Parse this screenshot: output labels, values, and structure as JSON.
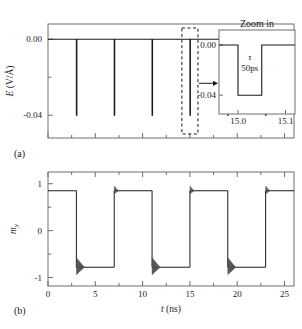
{
  "figure": {
    "panels": [
      {
        "id": "a",
        "label": "(a)",
        "ylabel": "E (V/Å)",
        "ylabel_parts": {
          "symbol": "E",
          "units": "(V/Å)"
        },
        "y_ticks": [
          "0.00",
          "-0.04"
        ],
        "x_ticks": [
          "",
          "",
          "",
          "",
          "",
          ""
        ]
      },
      {
        "id": "b",
        "label": "(b)",
        "ylabel": "m_y",
        "ylabel_parts": {
          "symbol": "m",
          "sub": "y"
        },
        "xlabel": "t (ns)",
        "xlabel_parts": {
          "symbol": "t",
          "units": "(ns)"
        },
        "y_ticks": [
          "1",
          "0",
          "-1"
        ],
        "x_ticks": [
          "0",
          "5",
          "10",
          "15",
          "20",
          "25"
        ]
      }
    ],
    "inset": {
      "title": "Zoom in",
      "y_ticks": [
        "0.00",
        "-0.04"
      ],
      "x_ticks": [
        "15.0",
        "15.1"
      ],
      "tau_symbol": "τ",
      "tau_value": "50ps"
    },
    "colors": {
      "line": "#1a1a1a",
      "axis": "#6e6e6e",
      "background": "#ffffff",
      "spike": "#4a4a4a"
    }
  },
  "chart_data": [
    {
      "type": "line",
      "id": "panel-a",
      "title": "",
      "xlabel": "",
      "ylabel": "E (V/Å)",
      "xlim": [
        0,
        26
      ],
      "ylim": [
        -0.052,
        0.008
      ],
      "yticks": [
        0.0,
        -0.04
      ],
      "ytick_labels": [
        "0.00",
        "-0.04"
      ],
      "xticks": [
        0,
        5,
        10,
        15,
        20,
        25
      ],
      "xtick_labels": [
        "",
        "",
        "",
        "",
        "",
        ""
      ],
      "grid": false,
      "description": "Electric field pulse train: baseline 0.00 V/A with narrow negative pulses of amplitude -0.04 V/A and width 50 ps",
      "baseline": 0.0,
      "pulse_amplitude": -0.04,
      "pulse_width_ns": 0.05,
      "pulse_times_ns": [
        3.0,
        7.0,
        11.0,
        15.0,
        19.0,
        23.0
      ],
      "highlight_box": {
        "center_ns": 15.0,
        "half_width_ns": 0.85
      }
    },
    {
      "type": "line",
      "id": "panel-a-inset",
      "title": "Zoom in",
      "xlabel": "",
      "ylabel": "",
      "xlim": [
        14.96,
        15.12
      ],
      "ylim": [
        -0.055,
        0.012
      ],
      "yticks": [
        0.0,
        -0.04
      ],
      "ytick_labels": [
        "0.00",
        "-0.04"
      ],
      "xticks": [
        15.0,
        15.1
      ],
      "xtick_labels": [
        "15.0",
        "15.1"
      ],
      "grid": false,
      "description": "Magnified single rectangular pulse of duration tau = 50 ps",
      "x": [
        14.96,
        15.0,
        15.0,
        15.05,
        15.05,
        15.12
      ],
      "y": [
        0.0,
        0.0,
        -0.04,
        -0.04,
        0.0,
        0.0
      ],
      "annotations": [
        {
          "text": "τ",
          "x": 15.025,
          "y": -0.012
        },
        {
          "text": "50ps",
          "x": 15.025,
          "y": -0.021
        }
      ]
    },
    {
      "type": "line",
      "id": "panel-b",
      "title": "",
      "xlabel": "t (ns)",
      "ylabel": "m_y",
      "xlim": [
        0,
        26
      ],
      "ylim": [
        -1.18,
        1.25
      ],
      "yticks": [
        1,
        0,
        -1
      ],
      "ytick_labels": [
        "1",
        "0",
        "-1"
      ],
      "xticks": [
        0,
        5,
        10,
        15,
        20,
        25
      ],
      "xtick_labels": [
        "0",
        "5",
        "10",
        "15",
        "20",
        "25"
      ],
      "grid": false,
      "description": "Magnetization y-component toggling between +0.85 and -0.78 at each field pulse, with damped ringing after each switch",
      "high_level": 0.85,
      "low_level": -0.78,
      "switch_times_ns": [
        3.0,
        7.0,
        11.0,
        15.0,
        19.0,
        23.0
      ],
      "x": [
        0,
        3.0,
        3.0,
        7.0,
        7.0,
        11.0,
        11.0,
        15.0,
        15.0,
        19.0,
        19.0,
        23.0,
        23.0,
        26.0
      ],
      "y": [
        0.85,
        0.85,
        -0.78,
        -0.78,
        0.85,
        0.85,
        -0.78,
        -0.78,
        0.85,
        0.85,
        -0.78,
        -0.78,
        0.85,
        0.85
      ]
    }
  ]
}
